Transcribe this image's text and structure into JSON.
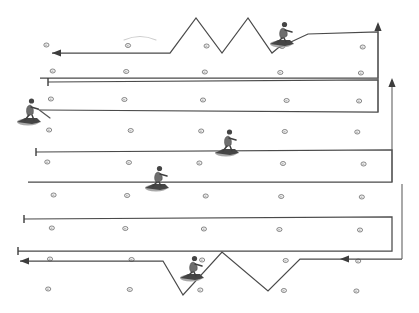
{
  "figure": {
    "width": 419,
    "height": 313,
    "background_color": "#ffffff",
    "line_color": "#4a4a4a",
    "marker_color": "#f2f2f2",
    "marker_outline_color": "#5a5a5a",
    "ghost_curve_color": "#cdcdcd",
    "arrow_color": "#3d3d3d"
  },
  "chart_data": {
    "type": "diagram",
    "xlabel": "",
    "ylabel": "",
    "marker_grid": {
      "columns": 5,
      "rows": 9,
      "column_x": [
        50,
        128,
        203,
        283,
        360
      ],
      "row_y": [
        46,
        72,
        100,
        131,
        163,
        196,
        229,
        260,
        290
      ],
      "marker_radius": 2.6
    },
    "paths": [
      {
        "name": "top-zigzag-sweep",
        "direction": "leftward",
        "terminator_start": "arrow",
        "terminator_end": "none",
        "points": [
          [
            52,
            53
          ],
          [
            170,
            53
          ],
          [
            196,
            18
          ],
          [
            222,
            53
          ],
          [
            248,
            18
          ],
          [
            272,
            53
          ],
          [
            278,
            48
          ],
          [
            308,
            34
          ],
          [
            378,
            32
          ],
          [
            378,
            78
          ],
          [
            118,
            78
          ],
          [
            40,
            78
          ]
        ]
      },
      {
        "name": "sweep-row-2",
        "direction": "rightward",
        "terminator_start": "t-bar",
        "terminator_end": "none",
        "points": [
          [
            48,
            82
          ],
          [
            378,
            80
          ],
          [
            378,
            112
          ],
          [
            40,
            110
          ]
        ]
      },
      {
        "name": "sweep-row-3",
        "direction": "rightward",
        "terminator_start": "t-bar",
        "terminator_end": "none",
        "points": [
          [
            36,
            152
          ],
          [
            392,
            150
          ],
          [
            392,
            182
          ],
          [
            28,
            182
          ]
        ]
      },
      {
        "name": "sweep-row-4",
        "direction": "rightward",
        "terminator_start": "t-bar",
        "terminator_end": "none",
        "points": [
          [
            24,
            219
          ],
          [
            392,
            217
          ],
          [
            392,
            251
          ],
          [
            18,
            251
          ]
        ]
      },
      {
        "name": "bottom-zigzag-sweep",
        "direction": "leftward",
        "terminator_start": "arrow",
        "terminator_end": "arrow",
        "points": [
          [
            20,
            261
          ],
          [
            163,
            261
          ],
          [
            183,
            295
          ],
          [
            222,
            252
          ],
          [
            268,
            291
          ],
          [
            300,
            259
          ],
          [
            370,
            259
          ],
          [
            402,
            259
          ]
        ]
      }
    ],
    "arrows": [
      {
        "name": "top-left-arrow",
        "x": 52,
        "y": 53,
        "direction": "left"
      },
      {
        "name": "bottom-left-arrow",
        "x": 20,
        "y": 261,
        "direction": "left"
      },
      {
        "name": "bottom-right-arrow",
        "x": 340,
        "y": 259,
        "direction": "left"
      },
      {
        "name": "right-upper-arrow",
        "x": 378,
        "y": 22,
        "direction": "up"
      },
      {
        "name": "right-lower-arrow",
        "x": 392,
        "y": 78,
        "direction": "up"
      }
    ],
    "end_bars": [
      {
        "name": "row2-start-bar",
        "x": 48,
        "y": 82
      },
      {
        "name": "row3-start-bar",
        "x": 36,
        "y": 152
      },
      {
        "name": "row4-start-bar",
        "x": 24,
        "y": 219
      },
      {
        "name": "row5-start-bar",
        "x": 18,
        "y": 251
      }
    ],
    "figures": [
      {
        "name": "skier-top-right",
        "x": 283,
        "y": 28,
        "facing": "right",
        "pose": "crouched"
      },
      {
        "name": "skier-left-row3",
        "x": 30,
        "y": 106,
        "facing": "right",
        "pose": "upright-with-pole"
      },
      {
        "name": "skier-mid-row4",
        "x": 228,
        "y": 137,
        "facing": "right",
        "pose": "upright"
      },
      {
        "name": "skier-mid-row5",
        "x": 158,
        "y": 172,
        "facing": "right",
        "pose": "crouched"
      },
      {
        "name": "skier-bottom-zigzag",
        "x": 193,
        "y": 262,
        "facing": "right",
        "pose": "crouched"
      }
    ],
    "ghost_curves": [
      {
        "name": "faint-curve-top",
        "points": [
          [
            124,
            40
          ],
          [
            140,
            36
          ],
          [
            156,
            40
          ]
        ]
      }
    ],
    "legend": [],
    "annotations": []
  }
}
